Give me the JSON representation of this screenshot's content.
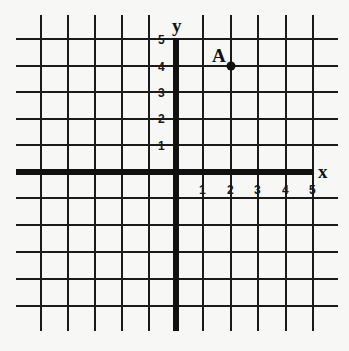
{
  "diagram": {
    "type": "coordinate-plane",
    "axes": {
      "x_label": "x",
      "y_label": "y",
      "x_ticks": [
        "1",
        "2",
        "3",
        "4",
        "5"
      ],
      "y_ticks": [
        "1",
        "2",
        "3",
        "4",
        "5"
      ],
      "x_range_visible": [
        -5,
        5
      ],
      "y_range_visible": [
        -6,
        5
      ]
    },
    "points": [
      {
        "label": "A",
        "x": 2,
        "y": 4
      }
    ],
    "colors": {
      "background": "#f7f7f5",
      "ink": "#111111"
    }
  }
}
